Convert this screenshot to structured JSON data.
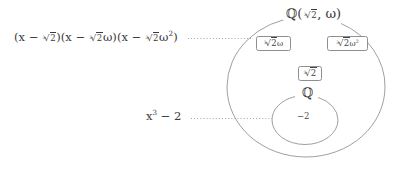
{
  "figure": {
    "title_label": "Q(∛2, ω)",
    "stroke_color": "#8e8e8e",
    "text_color": "#3a3a3a",
    "background": "#ffffff",
    "outer_set": {
      "name": "outer-field-ellipse",
      "label": "ℚ(∛2, ω)",
      "label_plain": "Q( 3√2, ω )"
    },
    "inner_set": {
      "name": "inner-field-circle",
      "label": "ℚ",
      "label_plain": "Q",
      "element": "−2"
    },
    "boxed_elements": [
      {
        "name": "root-times-omega",
        "label": "∛2ω"
      },
      {
        "name": "root-times-omega-squared",
        "label": "∛2ω²"
      },
      {
        "name": "real-cube-root",
        "label": "∛2"
      }
    ],
    "annotations": [
      {
        "name": "splitting-polynomial",
        "label": "(x − ∛2)(x − ∛2ω)(x − ∛2ω²)",
        "leader": "dotted",
        "points_to": "outer-field-ellipse"
      },
      {
        "name": "base-polynomial",
        "label": "x³ − 2",
        "leader": "dotted",
        "points_to": "inner-field-circle"
      }
    ]
  }
}
